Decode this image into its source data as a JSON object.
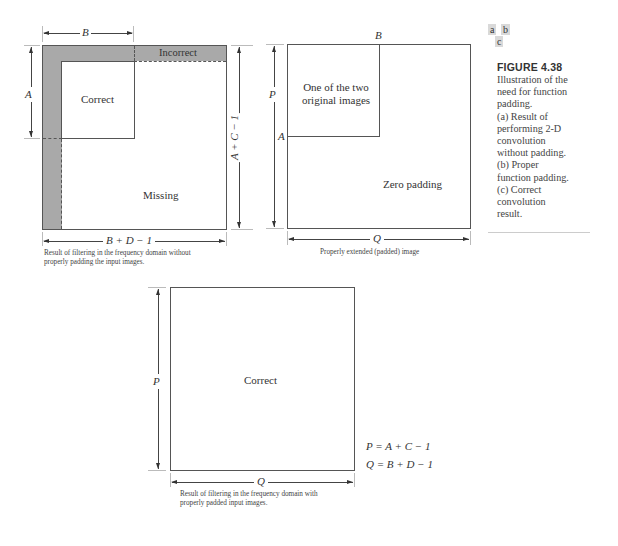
{
  "figure": {
    "panel_keys": [
      "a",
      "b",
      "c"
    ],
    "title": "FIGURE 4.38",
    "description_lines": [
      "Illustration of the",
      "need for function",
      "padding.",
      "(a) Result of",
      "performing 2-D",
      "convolution",
      "without padding.",
      "(b) Proper",
      "function padding.",
      "(c) Correct",
      "convolution",
      "result."
    ]
  },
  "panel_a": {
    "top_dim": "B",
    "left_dim": "A",
    "right_dim": "A + C − 1",
    "bottom_dim": "B + D − 1",
    "regions": {
      "incorrect": "Incorrect",
      "correct": "Correct",
      "missing": "Missing"
    },
    "caption_lines": [
      "Result of filtering in the frequency domain without",
      "properly padding the input images."
    ],
    "colors": {
      "padding_band": "#a9a9a9",
      "border": "#555555"
    }
  },
  "panel_b": {
    "corner_b": "B",
    "corner_a": "A",
    "left_dim": "P",
    "bottom_dim": "Q",
    "regions": {
      "original_line1": "One of the two",
      "original_line2": "original images",
      "zero_padding": "Zero padding"
    },
    "caption": "Properly extended (padded) image"
  },
  "panel_c": {
    "left_dim": "P",
    "bottom_dim": "Q",
    "region": "Correct",
    "caption_lines": [
      "Result of filtering in the frequency domain with",
      "properly padded input images."
    ],
    "equations": {
      "p": "P = A + C − 1",
      "q": "Q = B + D − 1"
    }
  }
}
